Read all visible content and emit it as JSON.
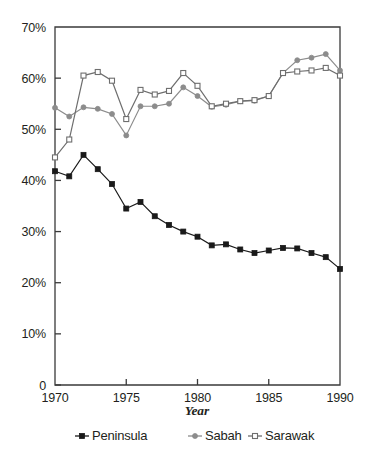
{
  "chart_data": {
    "type": "line",
    "title": "",
    "subtitle": "",
    "xlabel": "Year",
    "ylabel": "",
    "x": [
      1970,
      1971,
      1972,
      1973,
      1974,
      1975,
      1976,
      1977,
      1978,
      1979,
      1980,
      1981,
      1982,
      1983,
      1984,
      1985,
      1986,
      1987,
      1988,
      1989,
      1990
    ],
    "xlim": [
      1970,
      1990
    ],
    "ylim": [
      0,
      70
    ],
    "xticks": [
      1970,
      1975,
      1980,
      1985,
      1990
    ],
    "xtick_labels": [
      "1970",
      "1975",
      "1980",
      "1985",
      "1990"
    ],
    "yticks": [
      0,
      10,
      20,
      30,
      40,
      50,
      60,
      70
    ],
    "ytick_labels": [
      "0",
      "10%",
      "20%",
      "30%",
      "40%",
      "50%",
      "60%",
      "70%"
    ],
    "grid": false,
    "legend_position": "bottom",
    "series": [
      {
        "name": "Peninsula",
        "color": "#1a1a1a",
        "marker": "filled-square",
        "values": [
          41.8,
          40.8,
          45.0,
          42.2,
          39.3,
          34.5,
          35.8,
          33.0,
          31.3,
          30.0,
          29.0,
          27.3,
          27.5,
          26.5,
          25.8,
          26.3,
          26.8,
          26.7,
          25.8,
          25.0,
          22.7
        ]
      },
      {
        "name": "Sabah",
        "color": "#8c8c8c",
        "marker": "filled-circle",
        "values": [
          54.2,
          52.5,
          54.3,
          54.0,
          53.0,
          48.8,
          54.5,
          54.5,
          55.0,
          58.2,
          56.5,
          54.4,
          54.8,
          55.5,
          55.6,
          56.5,
          61.0,
          63.5,
          64.0,
          64.7,
          61.5
        ]
      },
      {
        "name": "Sarawak",
        "color": "#6e6e6e",
        "marker": "open-square",
        "values": [
          44.5,
          48.0,
          60.5,
          61.2,
          59.5,
          52.0,
          57.7,
          56.8,
          57.5,
          61.0,
          58.5,
          54.5,
          55.0,
          55.5,
          55.7,
          56.5,
          61.0,
          61.3,
          61.5,
          62.0,
          60.5
        ]
      }
    ],
    "legend": [
      {
        "label": "Peninsula",
        "marker": "filled-square",
        "color": "#1a1a1a"
      },
      {
        "label": "Sabah",
        "marker": "filled-circle",
        "color": "#8c8c8c"
      },
      {
        "label": "Sarawak",
        "marker": "open-square",
        "color": "#6e6e6e"
      }
    ]
  },
  "axis": {
    "y_labels": [
      "70%",
      "60%",
      "50%",
      "40%",
      "30%",
      "20%",
      "10%",
      "0"
    ],
    "x_labels": [
      "1970",
      "1975",
      "1980",
      "1985",
      "1990"
    ],
    "x_title": "Year"
  },
  "legend": {
    "peninsula": "Peninsula",
    "sabah": "Sabah",
    "sarawak": "Sarawak"
  },
  "colors": {
    "peninsula": "#1a1a1a",
    "sabah": "#8c8c8c",
    "sarawak": "#6e6e6e",
    "axis": "#3a3a3a",
    "text": "#231f20",
    "background": "#ffffff"
  }
}
